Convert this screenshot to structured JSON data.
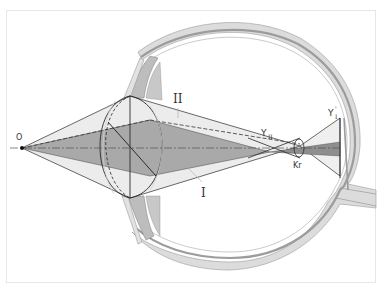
{
  "figure": {
    "type": "eye-optics-diagram",
    "labels": {
      "object_point": "O",
      "ray_bundle_1": "I",
      "ray_bundle_2": "II",
      "image_point_2": "Y",
      "image_point_2_sub": "II",
      "image_point_1": "Y",
      "image_point_1_prime": "'",
      "image_point_1_sub": "I",
      "circle_of_confusion": "Kr"
    },
    "colors": {
      "sclera_outer": "#d9d9d9",
      "sclera_band": "#a8a8a8",
      "sclera_inner": "#ececec",
      "bundle_dark": "#a6a6a6",
      "bundle_light": "#e6e6e6",
      "line": "#2a2a2a",
      "frame": "#e6e6e6"
    }
  }
}
